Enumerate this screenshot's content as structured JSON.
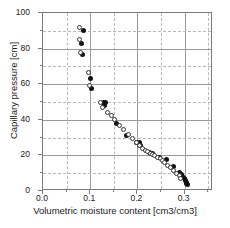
{
  "chart_data": {
    "type": "scatter",
    "title": "",
    "xlabel": "Volumetric moisture content [cm3/cm3]",
    "ylabel": "Capillary pressure [cm]",
    "xlim": [
      0.0,
      0.36
    ],
    "ylim": [
      0,
      100
    ],
    "xticks": [
      0.0,
      0.1,
      0.2,
      0.3
    ],
    "xticklabels": [
      "0.0",
      "0.1",
      "0.2",
      "0.3"
    ],
    "xminorticks": [
      0.05,
      0.15,
      0.25,
      0.35
    ],
    "yticks": [
      0,
      20,
      40,
      60,
      80,
      100
    ],
    "yticklabels": [
      "0",
      "20",
      "40",
      "60",
      "80",
      "100"
    ],
    "yminorticks": [
      10,
      30,
      50,
      70,
      90
    ],
    "grid": true,
    "grid_major_style": "solid",
    "grid_minor_style": "dashed",
    "legend": null,
    "legend_position": "none",
    "colors": {
      "filled_marker": "#111111",
      "open_marker_edge": "#333333",
      "open_marker_face": "#ffffff",
      "axis": "#7a7a7a",
      "grid_major": "#9a9a9a",
      "grid_minor": "#b9b9b9",
      "text": "#1a1a1a",
      "background": "#ffffff"
    },
    "series": [
      {
        "name": "filled",
        "marker": "filled-circle",
        "points": [
          [
            0.085,
            90.0
          ],
          [
            0.082,
            83.0
          ],
          [
            0.083,
            76.5
          ],
          [
            0.101,
            63.0
          ],
          [
            0.103,
            57.5
          ],
          [
            0.129,
            50.0
          ],
          [
            0.132,
            49.5
          ],
          [
            0.131,
            48.0
          ],
          [
            0.156,
            38.0
          ],
          [
            0.177,
            31.0
          ],
          [
            0.197,
            27.5
          ],
          [
            0.205,
            27.0
          ],
          [
            0.207,
            25.5
          ],
          [
            0.226,
            21.5
          ],
          [
            0.231,
            21.0
          ],
          [
            0.247,
            19.0
          ],
          [
            0.262,
            17.5
          ],
          [
            0.276,
            13.5
          ],
          [
            0.289,
            10.5
          ],
          [
            0.293,
            9.0
          ],
          [
            0.296,
            8.0
          ],
          [
            0.299,
            7.0
          ],
          [
            0.301,
            6.0
          ],
          [
            0.303,
            5.0
          ],
          [
            0.304,
            4.0
          ],
          [
            0.305,
            3.5
          ]
        ]
      },
      {
        "name": "open",
        "marker": "open-circle",
        "points": [
          [
            0.078,
            92.0
          ],
          [
            0.077,
            85.0
          ],
          [
            0.08,
            78.0
          ],
          [
            0.096,
            66.5
          ],
          [
            0.099,
            59.0
          ],
          [
            0.122,
            49.5
          ],
          [
            0.126,
            47.0
          ],
          [
            0.137,
            44.0
          ],
          [
            0.146,
            42.5
          ],
          [
            0.152,
            40.0
          ],
          [
            0.161,
            37.0
          ],
          [
            0.171,
            34.5
          ],
          [
            0.181,
            32.0
          ],
          [
            0.19,
            29.5
          ],
          [
            0.198,
            27.0
          ],
          [
            0.205,
            25.5
          ],
          [
            0.211,
            24.0
          ],
          [
            0.218,
            23.0
          ],
          [
            0.222,
            22.0
          ],
          [
            0.227,
            21.0
          ],
          [
            0.232,
            20.5
          ],
          [
            0.237,
            20.0
          ],
          [
            0.242,
            19.0
          ],
          [
            0.248,
            18.0
          ],
          [
            0.253,
            17.0
          ],
          [
            0.258,
            16.0
          ],
          [
            0.264,
            14.5
          ],
          [
            0.27,
            13.0
          ],
          [
            0.277,
            11.5
          ],
          [
            0.283,
            10.0
          ],
          [
            0.288,
            8.5
          ],
          [
            0.292,
            7.0
          ]
        ]
      }
    ]
  }
}
